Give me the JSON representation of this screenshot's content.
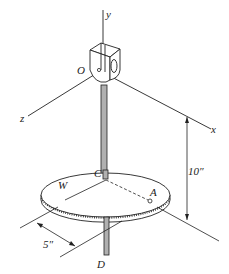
{
  "figure": {
    "labels": {
      "y_axis": "y",
      "x_axis": "x",
      "z_axis": "z",
      "origin": "O",
      "center": "C",
      "point_a": "A",
      "disk": "W",
      "bottom": "D",
      "height_dim": "10″",
      "offset_dim": "5″"
    },
    "colors": {
      "line": "#222222",
      "rod_fill": "#b0b0b0",
      "background": "#ffffff"
    }
  }
}
